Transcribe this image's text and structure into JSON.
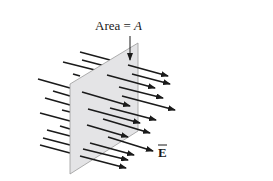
{
  "diagram": {
    "title_label": "Area = ",
    "title_symbol": "A",
    "field_label": "E",
    "field_vector_mark": "→",
    "colors": {
      "arrow": "#1a1a1a",
      "plane_fill": "#e4e4e6",
      "plane_edge": "#9a9a9a",
      "background": "#ffffff"
    },
    "elements": [
      {
        "name": "flat-surface-plane",
        "description": "Flat surface of area A tilted in perspective"
      },
      {
        "name": "electric-field-arrows",
        "description": "Uniform electric field lines passing through the surface"
      },
      {
        "name": "area-pointer-arrow",
        "description": "Arrow pointing from the label to the surface"
      }
    ]
  }
}
